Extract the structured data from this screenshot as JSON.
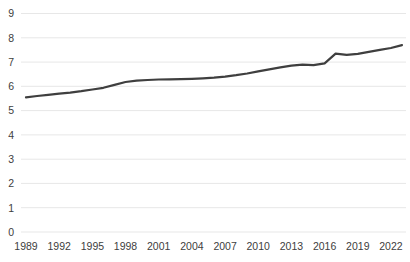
{
  "chart_data": {
    "type": "line",
    "title": "",
    "xlabel": "",
    "ylabel": "",
    "x": [
      1989,
      1990,
      1991,
      1992,
      1993,
      1994,
      1995,
      1996,
      1997,
      1998,
      1999,
      2000,
      2001,
      2002,
      2003,
      2004,
      2005,
      2006,
      2007,
      2008,
      2009,
      2010,
      2011,
      2012,
      2013,
      2014,
      2015,
      2016,
      2017,
      2018,
      2019,
      2020,
      2021,
      2022,
      2023
    ],
    "series": [
      {
        "name": "trend",
        "color": "#3f3f3f",
        "values": [
          5.55,
          5.6,
          5.65,
          5.7,
          5.74,
          5.8,
          5.87,
          5.94,
          6.06,
          6.18,
          6.23,
          6.26,
          6.28,
          6.29,
          6.3,
          6.31,
          6.33,
          6.36,
          6.4,
          6.46,
          6.53,
          6.62,
          6.7,
          6.78,
          6.85,
          6.89,
          6.87,
          6.95,
          7.35,
          7.3,
          7.34,
          7.42,
          7.5,
          7.58,
          7.7
        ]
      }
    ],
    "x_ticks": [
      1989,
      1992,
      1995,
      1998,
      2001,
      2004,
      2007,
      2010,
      2013,
      2016,
      2019,
      2022
    ],
    "y_ticks": [
      0,
      1,
      2,
      3,
      4,
      5,
      6,
      7,
      8,
      9
    ],
    "xlim": [
      1989,
      2023
    ],
    "ylim": [
      0,
      9
    ],
    "grid": "horizontal-only",
    "legend": "none",
    "colors": {
      "background": "#ffffff",
      "gridline": "#e7e7e7",
      "tick_label": "#404040",
      "line": "#3f3f3f"
    }
  }
}
